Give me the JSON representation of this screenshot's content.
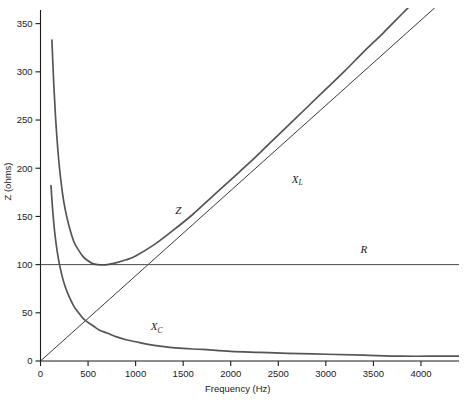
{
  "chart_data": {
    "type": "line",
    "title": "",
    "xlabel": "Frequency (Hz)",
    "ylabel": "Z (ohms)",
    "xlim": [
      0,
      4400
    ],
    "ylim": [
      0,
      360
    ],
    "grid": false,
    "legend_position": "inline-curve-labels",
    "xticks": [
      0,
      500,
      1000,
      1500,
      2000,
      2500,
      3000,
      3500,
      4000
    ],
    "xticklabels": [
      "0",
      "500",
      "1000",
      "1500",
      "2000",
      "2500",
      "3000",
      "3500",
      "4000"
    ],
    "yticks": [
      0,
      50,
      100,
      150,
      200,
      250,
      300,
      350
    ],
    "yticklabels": [
      "0",
      "50",
      "100",
      "150",
      "200",
      "250",
      "300",
      "350"
    ],
    "series": [
      {
        "name": "Z",
        "label": "Z",
        "label_x": 1450,
        "label_y": 152,
        "x": [
          120,
          140,
          160,
          180,
          200,
          230,
          260,
          300,
          350,
          400,
          450,
          500,
          550,
          600,
          700,
          800,
          900,
          1000,
          1200,
          1400,
          1600,
          1800,
          2000,
          2200,
          2400,
          2600,
          2800,
          3000,
          3200,
          3400,
          3600,
          3800,
          4000,
          4200,
          4400
        ],
        "y": [
          333,
          286,
          250,
          222,
          200,
          175,
          157,
          140,
          124,
          115,
          108,
          104,
          101,
          100,
          100,
          102,
          105,
          109,
          121,
          136,
          152,
          170,
          188,
          206,
          225,
          244,
          263,
          282,
          301,
          321,
          340,
          360,
          380,
          400,
          420
        ]
      },
      {
        "name": "X_L",
        "label": "X",
        "label_sub": "L",
        "label_x": 2700,
        "label_y": 185,
        "x": [
          0,
          4400
        ],
        "y": [
          0,
          389
        ]
      },
      {
        "name": "R",
        "label": "R",
        "label_x": 3400,
        "label_y": 112,
        "x": [
          0,
          4400
        ],
        "y": [
          100,
          100
        ]
      },
      {
        "name": "X_C",
        "label": "X",
        "label_sub": "C",
        "label_x": 1220,
        "label_y": 32,
        "x": [
          110,
          130,
          150,
          175,
          200,
          230,
          260,
          300,
          350,
          400,
          450,
          500,
          560,
          620,
          700,
          800,
          900,
          1000,
          1150,
          1300,
          1500,
          1700,
          2000,
          2300,
          2600,
          3000,
          3400,
          3800,
          4200,
          4400
        ],
        "y": [
          182,
          154,
          133,
          114,
          100,
          87,
          77,
          67,
          57,
          50,
          44,
          40,
          36,
          32,
          29,
          25,
          22,
          20,
          17,
          15,
          13,
          12,
          10,
          9,
          8,
          7,
          6,
          5,
          5,
          5
        ]
      }
    ],
    "colors": {
      "axis": "#1a1a1a",
      "curve_z": "#555555",
      "curve_xl": "#3a3a3a",
      "curve_r": "#4a4a4a",
      "curve_xc": "#555555",
      "background": "#ffffff"
    }
  },
  "caption": {
    "text": ""
  }
}
